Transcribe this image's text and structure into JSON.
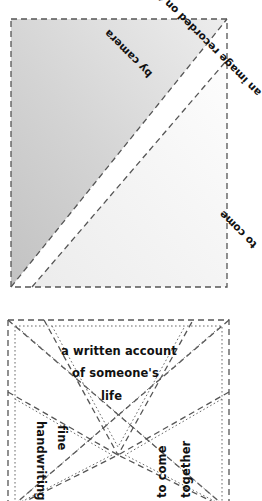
{
  "diagram": {
    "background_color": "#ffffff",
    "ink_color": "#111111",
    "line_color": "#4a4a4a",
    "shade_light": "#f2f2f2",
    "shade_dark": "#c6c6c6"
  },
  "panels": {
    "top": {
      "name": "shaded-fold-panel",
      "outline_style": "dashed",
      "shaded_region": "upper-left triangle",
      "labels": [
        {
          "id": "film",
          "text": "an image recorded on film",
          "rotation": 225
        },
        {
          "id": "camera",
          "text": "by camera",
          "rotation": 225
        },
        {
          "id": "tocome",
          "text": "to come",
          "rotation": 225
        }
      ]
    },
    "bottom": {
      "name": "fortune-teller-fold-panel",
      "outline_style": "dashed and dotted double lines",
      "flaps": [
        {
          "id": "top-flap",
          "position": "top",
          "rotation": 0,
          "lines": [
            "a written account",
            "of someone's",
            "life"
          ]
        },
        {
          "id": "left-flap",
          "position": "left",
          "rotation": 90,
          "lines": [
            "handwriting",
            "fine"
          ]
        },
        {
          "id": "right-flap",
          "position": "right",
          "rotation": -90,
          "lines": [
            "to come",
            "together"
          ]
        }
      ]
    }
  },
  "text": {
    "film": "an image recorded on film",
    "camera": "by camera",
    "tocome_top": "to come",
    "account": "a written account",
    "someone": "of someone's",
    "life": "life",
    "handwriting": "handwriting",
    "fine": "fine",
    "tocome_bottom": "to come",
    "together": "together"
  }
}
